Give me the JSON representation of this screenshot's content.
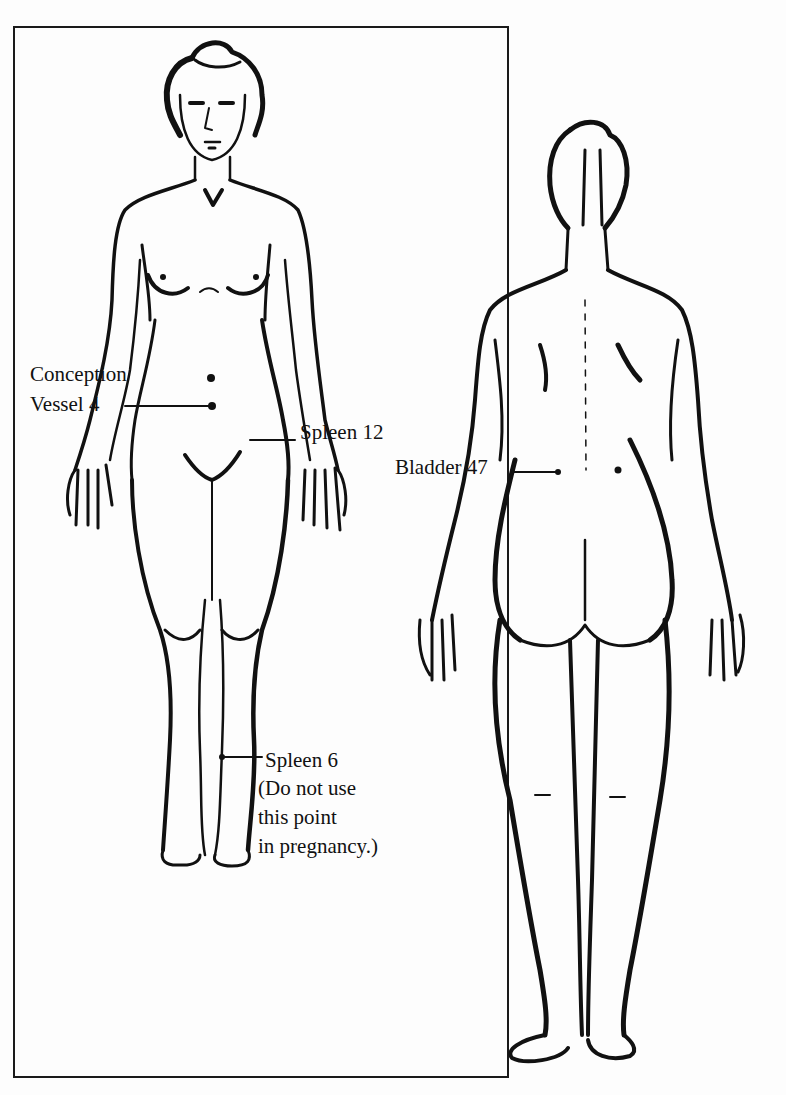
{
  "figure": {
    "top_text_fragment": "p",
    "views": [
      {
        "id": "front",
        "label": "Front view (female figure)"
      },
      {
        "id": "back",
        "label": "Back view (female figure)"
      }
    ],
    "points": {
      "conception_vessel_4": {
        "line1": "Conception",
        "line2": "Vessel 4"
      },
      "spleen_12": {
        "label": "Spleen 12"
      },
      "bladder_47": {
        "label": "Bladder 47"
      },
      "spleen_6": {
        "label": "Spleen 6",
        "note_lines": [
          "(Do not use",
          "this point",
          "in pregnancy.)"
        ]
      }
    }
  }
}
